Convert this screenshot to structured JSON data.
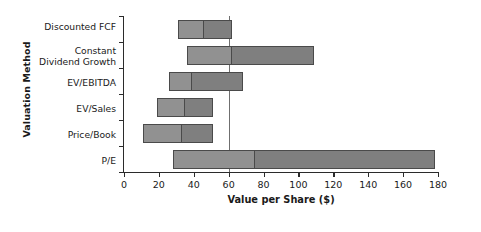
{
  "chart_data": {
    "type": "bar",
    "subtype": "horizontal-floating-range-bar",
    "title": "",
    "xlabel": "Value per Share ($)",
    "ylabel": "Valuation Method",
    "xlim": [
      0,
      180
    ],
    "ylim": null,
    "grid": false,
    "legend": null,
    "xticks": [
      0,
      20,
      40,
      60,
      80,
      100,
      120,
      140,
      160,
      180
    ],
    "xtick_labels": [
      "0",
      "20",
      "40",
      "60",
      "80",
      "100",
      "120",
      "140",
      "160",
      "180"
    ],
    "categories": [
      "Discounted FCF",
      "Constant\nDividend Growth",
      "EV/EBITDA",
      "EV/Sales",
      "Price/Book",
      "P/E"
    ],
    "series": [
      {
        "name": "Low to midpoint",
        "color": "#919191",
        "values": [
          {
            "category": "Discounted FCF",
            "start": 31,
            "end": 45
          },
          {
            "category": "Constant\nDividend Growth",
            "start": 36,
            "end": 61
          },
          {
            "category": "EV/EBITDA",
            "start": 26,
            "end": 38
          },
          {
            "category": "EV/Sales",
            "start": 19,
            "end": 34
          },
          {
            "category": "Price/Book",
            "start": 11,
            "end": 32
          },
          {
            "category": "P/E",
            "start": 28,
            "end": 74
          }
        ]
      },
      {
        "name": "Midpoint to high",
        "color": "#7f7f7f",
        "values": [
          {
            "category": "Discounted FCF",
            "start": 45,
            "end": 62
          },
          {
            "category": "Constant\nDividend Growth",
            "start": 61,
            "end": 109
          },
          {
            "category": "EV/EBITDA",
            "start": 38,
            "end": 68
          },
          {
            "category": "EV/Sales",
            "start": 34,
            "end": 51
          },
          {
            "category": "Price/Book",
            "start": 32,
            "end": 51
          },
          {
            "category": "P/E",
            "start": 74,
            "end": 178
          }
        ]
      }
    ],
    "bars": [
      {
        "category": "Discounted FCF",
        "low": 31,
        "mid": 45,
        "high": 62
      },
      {
        "category": "Constant\nDividend Growth",
        "low": 36,
        "mid": 61,
        "high": 109
      },
      {
        "category": "EV/EBITDA",
        "low": 26,
        "mid": 38,
        "high": 68
      },
      {
        "category": "EV/Sales",
        "low": 19,
        "mid": 34,
        "high": 51
      },
      {
        "category": "Price/Book",
        "low": 11,
        "mid": 32,
        "high": 51
      },
      {
        "category": "P/E",
        "low": 28,
        "mid": 74,
        "high": 178
      }
    ],
    "reference_line": {
      "value": 60,
      "color": "#6f6f6f",
      "orientation": "vertical"
    },
    "colors": {
      "segment_low": "#919191",
      "segment_high": "#7f7f7f",
      "bar_border": "#4a4a4a",
      "axis": "#2b2b2b",
      "text": "#1a1a1a",
      "background": "#ffffff"
    }
  }
}
